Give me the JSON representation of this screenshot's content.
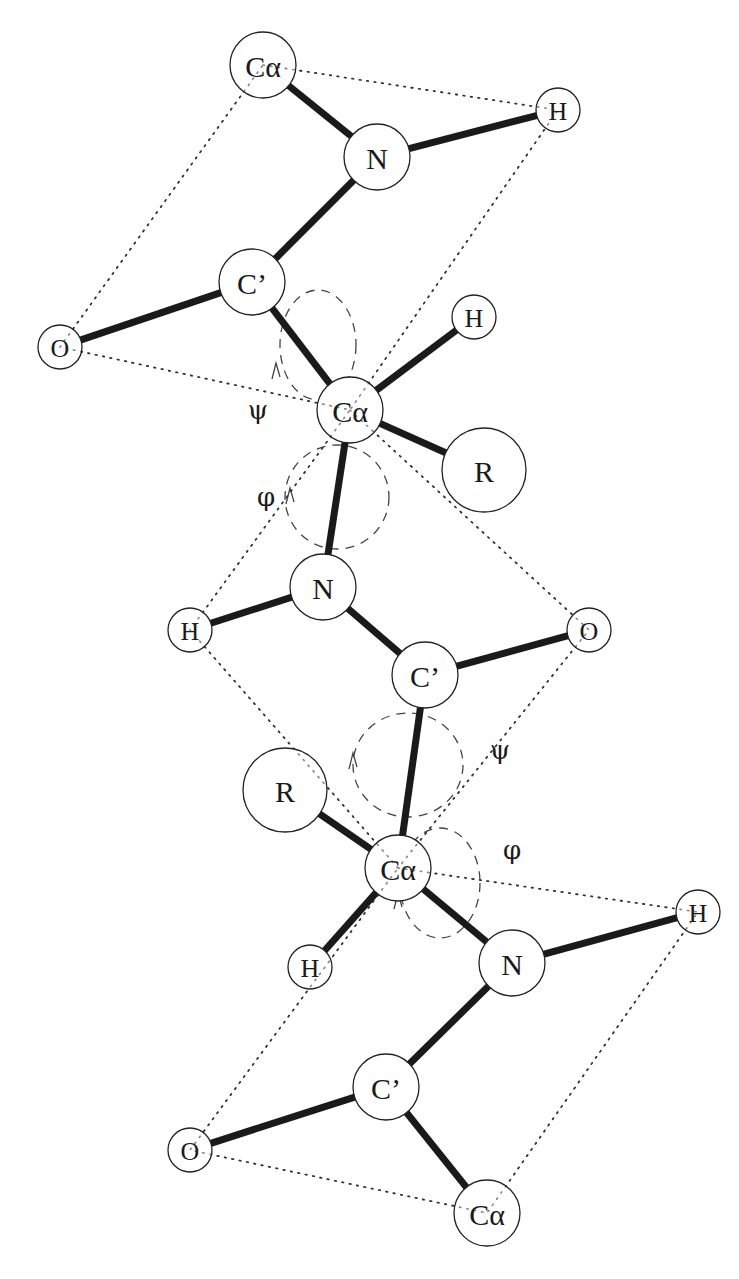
{
  "diagram": {
    "colors": {
      "bond": "#1a1a1a",
      "atom_stroke": "#222222",
      "plane": "#333333",
      "arc": "#444444",
      "background": "#ffffff"
    },
    "atoms": [
      {
        "id": "ca1",
        "label": "Cα",
        "x": 263,
        "y": 65,
        "r": 33,
        "size": 30
      },
      {
        "id": "n1",
        "label": "N",
        "x": 377,
        "y": 157,
        "r": 33,
        "size": 30
      },
      {
        "id": "h1",
        "label": "H",
        "x": 558,
        "y": 110,
        "r": 22,
        "size": 26
      },
      {
        "id": "c1",
        "label": "C’",
        "x": 252,
        "y": 282,
        "r": 33,
        "size": 30
      },
      {
        "id": "o1",
        "label": "O",
        "x": 60,
        "y": 347,
        "r": 22,
        "size": 26
      },
      {
        "id": "h2",
        "label": "H",
        "x": 474,
        "y": 317,
        "r": 22,
        "size": 26
      },
      {
        "id": "ca2",
        "label": "Cα",
        "x": 350,
        "y": 410,
        "r": 33,
        "size": 30
      },
      {
        "id": "r1",
        "label": "R",
        "x": 484,
        "y": 470,
        "r": 42,
        "size": 30
      },
      {
        "id": "n2",
        "label": "N",
        "x": 323,
        "y": 587,
        "r": 33,
        "size": 30
      },
      {
        "id": "h3",
        "label": "H",
        "x": 190,
        "y": 630,
        "r": 22,
        "size": 26
      },
      {
        "id": "o2",
        "label": "O",
        "x": 589,
        "y": 630,
        "r": 22,
        "size": 26
      },
      {
        "id": "c2",
        "label": "C’",
        "x": 425,
        "y": 675,
        "r": 33,
        "size": 30
      },
      {
        "id": "r2",
        "label": "R",
        "x": 285,
        "y": 790,
        "r": 42,
        "size": 30
      },
      {
        "id": "ca3",
        "label": "Cα",
        "x": 398,
        "y": 868,
        "r": 33,
        "size": 30
      },
      {
        "id": "h4",
        "label": "H",
        "x": 310,
        "y": 967,
        "r": 22,
        "size": 26
      },
      {
        "id": "n3",
        "label": "N",
        "x": 512,
        "y": 963,
        "r": 33,
        "size": 30
      },
      {
        "id": "h5",
        "label": "H",
        "x": 698,
        "y": 912,
        "r": 22,
        "size": 26
      },
      {
        "id": "c3",
        "label": "C’",
        "x": 386,
        "y": 1087,
        "r": 33,
        "size": 30
      },
      {
        "id": "o3",
        "label": "O",
        "x": 190,
        "y": 1150,
        "r": 22,
        "size": 26
      },
      {
        "id": "ca4",
        "label": "Cα",
        "x": 487,
        "y": 1213,
        "r": 33,
        "size": 30
      }
    ],
    "bonds": [
      [
        "ca1",
        "n1"
      ],
      [
        "n1",
        "h1"
      ],
      [
        "n1",
        "c1"
      ],
      [
        "c1",
        "o1"
      ],
      [
        "c1",
        "ca2"
      ],
      [
        "ca2",
        "h2"
      ],
      [
        "ca2",
        "r1"
      ],
      [
        "ca2",
        "n2"
      ],
      [
        "n2",
        "h3"
      ],
      [
        "n2",
        "c2"
      ],
      [
        "c2",
        "o2"
      ],
      [
        "c2",
        "ca3"
      ],
      [
        "ca3",
        "r2"
      ],
      [
        "ca3",
        "h4"
      ],
      [
        "ca3",
        "n3"
      ],
      [
        "n3",
        "h5"
      ],
      [
        "n3",
        "c3"
      ],
      [
        "c3",
        "o3"
      ],
      [
        "c3",
        "ca4"
      ]
    ],
    "planes": [
      {
        "name": "peptide-plane-1",
        "atoms": [
          "ca1",
          "h1",
          "ca2",
          "o1"
        ]
      },
      {
        "name": "peptide-plane-2",
        "atoms": [
          "ca2",
          "o2",
          "ca3",
          "h3"
        ]
      },
      {
        "name": "peptide-plane-3",
        "atoms": [
          "ca3",
          "h5",
          "ca4",
          "o3"
        ]
      }
    ],
    "rotation_arcs": [
      {
        "name": "psi-arc-1",
        "cx": 318,
        "cy": 345,
        "rx": 38,
        "ry": 55,
        "rot": 0,
        "arrow": {
          "x": 276,
          "y": 375,
          "dir": "up"
        }
      },
      {
        "name": "phi-arc-1",
        "cx": 337,
        "cy": 497,
        "rx": 52,
        "ry": 52,
        "rot": 0,
        "arrow": {
          "x": 290,
          "y": 500,
          "dir": "up"
        }
      },
      {
        "name": "psi-arc-2",
        "cx": 408,
        "cy": 765,
        "rx": 55,
        "ry": 52,
        "rot": 0,
        "arrow": {
          "x": 353,
          "y": 765,
          "dir": "up"
        }
      },
      {
        "name": "phi-arc-2",
        "cx": 440,
        "cy": 883,
        "rx": 40,
        "ry": 55,
        "rot": 0,
        "arrow": {
          "x": 398,
          "y": 905,
          "dir": "up"
        }
      }
    ],
    "angle_labels": [
      {
        "name": "psi-label-1",
        "text": "ψ",
        "x": 258,
        "y": 410
      },
      {
        "name": "phi-label-1",
        "text": "φ",
        "x": 266,
        "y": 497
      },
      {
        "name": "psi-label-2",
        "text": "ψ",
        "x": 500,
        "y": 750
      },
      {
        "name": "phi-label-2",
        "text": "φ",
        "x": 512,
        "y": 850
      }
    ]
  }
}
